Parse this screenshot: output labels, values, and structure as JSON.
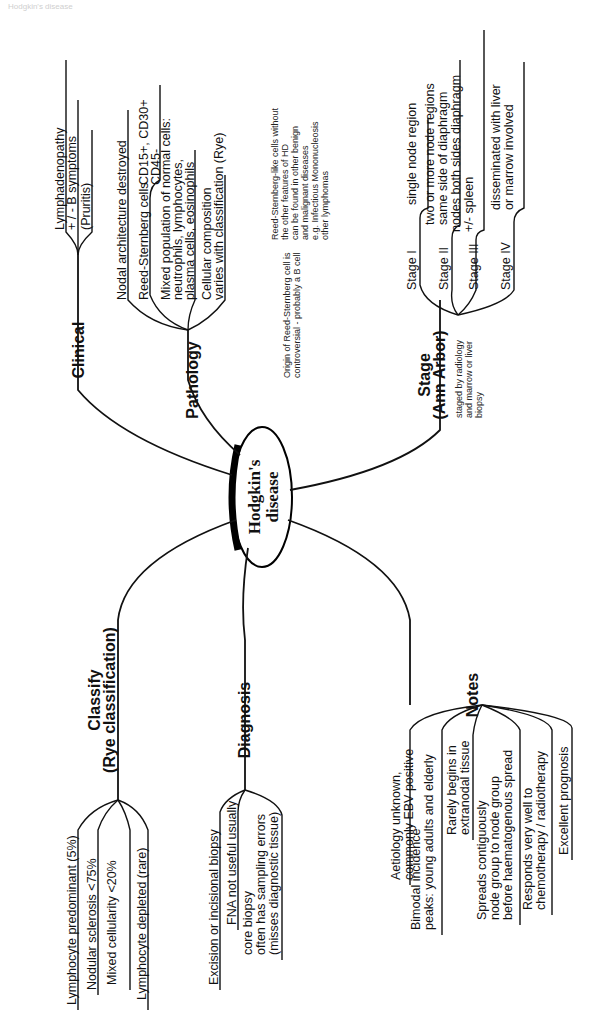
{
  "page": {
    "header_left": "Hodgkin's disease",
    "header_right": ""
  },
  "center": {
    "line1": "Hodgkin's",
    "line2": "disease"
  },
  "clinical": {
    "title": "Clinical",
    "items": [
      "Lymphadenopathy",
      "+ / -  B symptoms",
      "(Pruritis)"
    ]
  },
  "pathology": {
    "title": "Pathology",
    "items": [
      "Nodal architecture destroyed",
      "Reed-Sternberg cells",
      "Mixed population of normal cells:",
      "neutrophils, lymphocytes,",
      "plasma cells, eosinophils",
      "Cellular composition",
      "varies with classification (Rye)"
    ],
    "rs_markers": [
      "CD15+, CD30+",
      "CD45-"
    ],
    "note_origin": [
      "Origin of Reed-Sternberg cell is",
      "controversial - probably a B cell"
    ],
    "note_rs_like": [
      "Reed-Sternberg-like cells without",
      "the other features of HD",
      "can be found in other benign",
      "and malignant diseases",
      "e.g. Infectious Mononucleosis",
      "other lymphomas"
    ]
  },
  "stage": {
    "title_line1": "Stage",
    "title_line2": "(Ann Arbor)",
    "note": [
      "staged by radiology",
      "and marrow or liver",
      "biopsy"
    ],
    "items": [
      {
        "label": "Stage I",
        "desc": [
          "single node region"
        ]
      },
      {
        "label": "Stage II",
        "desc": [
          "two or more node regions",
          "same side of diaphragm"
        ]
      },
      {
        "label": "Stage III",
        "desc": [
          "nodes both sides diaphragm",
          "+/- spleen"
        ]
      },
      {
        "label": "Stage IV",
        "desc": [
          "disseminated with liver",
          "or marrow involved"
        ]
      }
    ]
  },
  "classify": {
    "title_line1": "Classify",
    "title_line2": "(Rye classification)",
    "items": [
      "Lymphocyte predominant (5%)",
      "Nodular sclerosis <75%",
      "Mixed cellularity <20%",
      "Lymphocyte depleted (rare)"
    ]
  },
  "diagnosis": {
    "title": "Diagnosis",
    "items": [
      "Excision or incisional biopsy",
      "FNA not useful usually",
      "core biopsy",
      "often has sampling errors",
      "(misses diagnostic tissue)"
    ]
  },
  "notes": {
    "title": "Notes",
    "items": [
      [
        "Aetiology unknown,",
        "commonly EBV positive"
      ],
      [
        "Bimodal incidence",
        "peaks: young adults and elderly"
      ],
      [
        "Rarely begins in",
        "extranodal tissue"
      ],
      [
        "Spreads contiguously",
        "node group to node group",
        "before haematogenous spread"
      ],
      [
        "Responds very well to",
        "chemotherapy / radiotherapy"
      ],
      [
        "Excellent prognosis"
      ]
    ]
  }
}
